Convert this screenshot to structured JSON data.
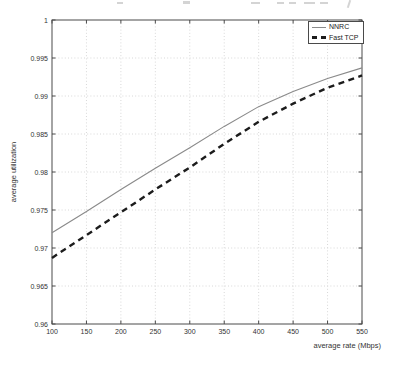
{
  "chart_data": {
    "type": "line",
    "title": "",
    "xlabel": "average rate (Mbps)",
    "ylabel": "average utilization",
    "xlim": [
      100,
      550
    ],
    "ylim": [
      0.96,
      1
    ],
    "xticks": [
      100,
      150,
      200,
      250,
      300,
      350,
      400,
      450,
      500,
      550
    ],
    "xtick_labels": [
      "100",
      "150",
      "200",
      "250",
      "300",
      "350",
      "400",
      "450",
      "500",
      "550"
    ],
    "yticks": [
      0.96,
      0.965,
      0.97,
      0.975,
      0.98,
      0.985,
      0.99,
      0.995,
      1
    ],
    "ytick_labels": [
      "0.96",
      "0.965",
      "0.97",
      "0.975",
      "0.98",
      "0.985",
      "0.99",
      "0.995",
      "1"
    ],
    "grid": true,
    "legend_position": "top-right",
    "x": [
      100,
      150,
      200,
      250,
      300,
      350,
      400,
      450,
      500,
      550
    ],
    "series": [
      {
        "name": "NNRC",
        "values": [
          0.972,
          0.9748,
          0.9777,
          0.9805,
          0.9832,
          0.986,
          0.9886,
          0.9906,
          0.9923,
          0.9937
        ],
        "line_style": "solid",
        "color": "#8a8a8a",
        "width": 1.1
      },
      {
        "name": "Fast TCP",
        "values": [
          0.9687,
          0.9717,
          0.9747,
          0.9777,
          0.9806,
          0.9837,
          0.9866,
          0.989,
          0.9911,
          0.9927
        ],
        "line_style": "dashed",
        "color": "#1c1c1c",
        "width": 2.4
      }
    ]
  },
  "colors": {
    "frame": "#4a4a4a",
    "grid": "#d8d8d8",
    "text": "#333333",
    "background": "#ffffff"
  }
}
